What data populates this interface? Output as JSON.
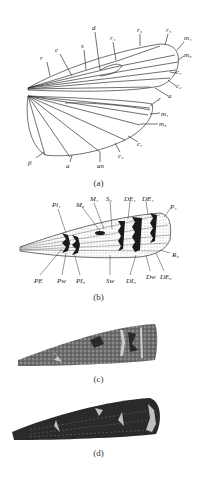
{
  "figure": {
    "panels": [
      {
        "id": "a",
        "caption": "(a)",
        "description": "Wing venation diagram (forewing and hindwing)",
        "forewing_labels": [
          "r",
          "c",
          "s",
          "d",
          "r1",
          "r2",
          "r5",
          "m1",
          "m3",
          "c1",
          "c2",
          "a"
        ],
        "hindwing_labels": [
          "r",
          "m1",
          "m3",
          "c1",
          "c2",
          "an",
          "a",
          "β"
        ]
      },
      {
        "id": "b",
        "caption": "(b)",
        "description": "Forewing pattern elements diagram",
        "labels_top": [
          "Pi1",
          "M2",
          "M1",
          "S1",
          "DE1",
          "DE1",
          "P1"
        ],
        "labels_bottom": [
          "PE",
          "Pw",
          "PI3",
          "Sw",
          "DI6",
          "Dw",
          "DE6"
        ],
        "labels_right": [
          "R3"
        ]
      },
      {
        "id": "c",
        "caption": "(c)",
        "description": "Forewing specimen, mottled grey"
      },
      {
        "id": "d",
        "caption": "(d)",
        "description": "Forewing specimen, dark"
      }
    ],
    "colors": {
      "line": "#333333",
      "dark_wing": "#2a2a2a",
      "grey_wing": "#6e6e6e",
      "background": "#ffffff"
    }
  }
}
